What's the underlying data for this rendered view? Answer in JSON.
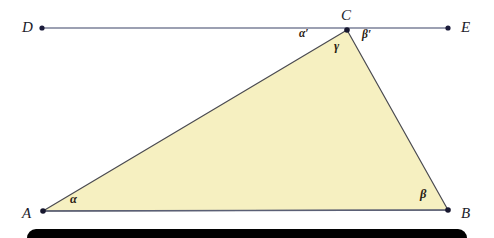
{
  "figure": {
    "type": "geometry-diagram",
    "background_color": "#ffffff",
    "triangle": {
      "name": "triangle-ABC",
      "fill_color": "#F6F0C1",
      "stroke_color": "#4a4a50",
      "stroke_width": 1.2,
      "vertices": [
        {
          "label": "A",
          "x": 43,
          "y": 211
        },
        {
          "label": "B",
          "x": 448,
          "y": 210
        },
        {
          "label": "C",
          "x": 347,
          "y": 30
        }
      ]
    },
    "line_de": {
      "name": "line-DE",
      "stroke_color": "#7b8099",
      "stroke_width": 1.6,
      "from": {
        "label": "D",
        "x": 42,
        "y": 28
      },
      "to": {
        "label": "E",
        "x": 448,
        "y": 28
      }
    },
    "points": [
      {
        "id": "point-D",
        "label": "D",
        "x": 42,
        "y": 28,
        "label_x": 22,
        "label_y": 20,
        "dot": true
      },
      {
        "id": "point-E",
        "label": "E",
        "x": 448,
        "y": 28,
        "label_x": 461,
        "label_y": 20,
        "dot": true
      },
      {
        "id": "point-C",
        "label": "C",
        "x": 347,
        "y": 30,
        "label_x": 341,
        "label_y": 8,
        "dot": true
      },
      {
        "id": "point-A",
        "label": "A",
        "x": 43,
        "y": 211,
        "label_x": 22,
        "label_y": 206,
        "dot": true
      },
      {
        "id": "point-B",
        "label": "B",
        "x": 448,
        "y": 210,
        "label_x": 461,
        "label_y": 206,
        "dot": true
      }
    ],
    "angles": [
      {
        "id": "angle-alpha",
        "label": "α",
        "x": 70,
        "y": 193,
        "size": "normal"
      },
      {
        "id": "angle-beta",
        "label": "β",
        "x": 420,
        "y": 188,
        "size": "normal"
      },
      {
        "id": "angle-gamma",
        "label": "γ",
        "x": 334,
        "y": 40,
        "size": "normal"
      },
      {
        "id": "angle-alpha-prime",
        "label": "α′",
        "x": 299,
        "y": 28,
        "size": "small"
      },
      {
        "id": "angle-beta-prime",
        "label": "β′",
        "x": 362,
        "y": 29,
        "size": "small"
      }
    ],
    "black_bar": {
      "name": "black-bar",
      "color": "#010101",
      "x": 27,
      "y": 229,
      "width": 440,
      "height": 22
    }
  }
}
